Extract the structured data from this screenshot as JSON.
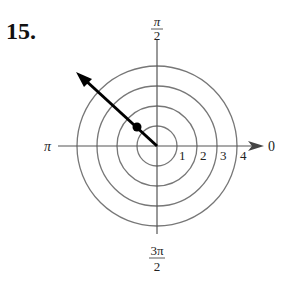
{
  "problem_number": "15.",
  "polar_plot": {
    "angle_labels": {
      "right": "0",
      "top_num": "π",
      "top_den": "2",
      "left": "π",
      "bottom_num": "3π",
      "bottom_den": "2"
    },
    "radius_labels": [
      "1",
      "2",
      "3",
      "4"
    ],
    "circle_radii": [
      1,
      2,
      3,
      4
    ],
    "point": {
      "r": 1.41,
      "theta": "3π/4"
    },
    "ray": {
      "theta": "3π/4",
      "direction": "outward"
    },
    "colors": {
      "grid": "#777777",
      "ray": "#000000"
    }
  }
}
